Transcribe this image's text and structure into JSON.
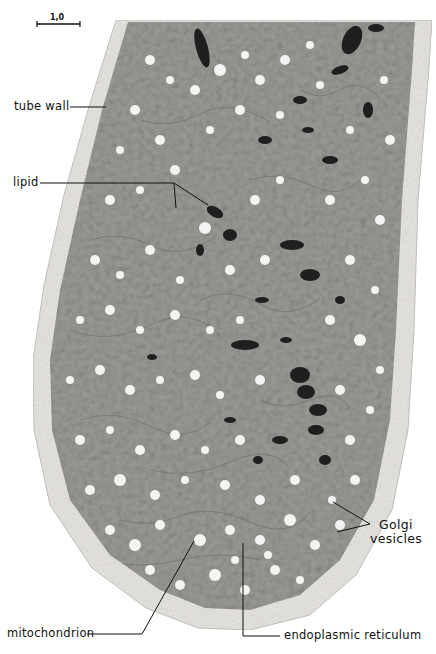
{
  "figure": {
    "type": "electron micrograph",
    "scale_bar": {
      "label": "1,0",
      "unit_hint": "µ"
    },
    "labels": [
      {
        "id": "tube-wall",
        "text": "tube wall"
      },
      {
        "id": "lipid",
        "text": "lipid"
      },
      {
        "id": "golgi-vesicles-line1",
        "text": "Golgi"
      },
      {
        "id": "golgi-vesicles-line2",
        "text": "vesicles"
      },
      {
        "id": "mitochondrion",
        "text": "mitochondrion"
      },
      {
        "id": "endoplasmic-reticulum",
        "text": "endoplasmic reticulum"
      }
    ],
    "colors": {
      "background": "#ffffff",
      "wall": "#e9e7e3",
      "cytoplasm": "#9a9896",
      "dense_bodies": "#1c1c1c",
      "vesicles": "#f4f4f2",
      "line": "#111111"
    }
  }
}
